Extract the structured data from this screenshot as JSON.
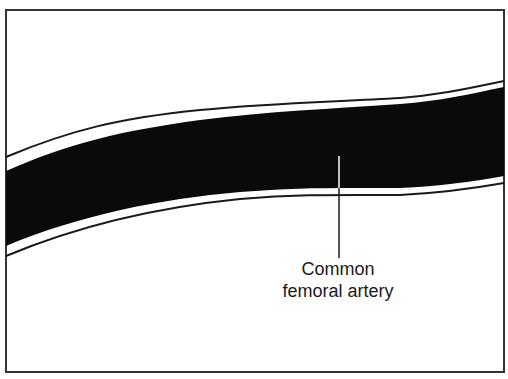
{
  "diagram": {
    "title": "",
    "structure": "artery",
    "label": {
      "line1": "Common",
      "line2": "femoral artery"
    },
    "colors": {
      "lumen": "#0a0a0a",
      "wall_line": "#1a1a1a",
      "background": "#ffffff",
      "frame": "#333333"
    }
  }
}
